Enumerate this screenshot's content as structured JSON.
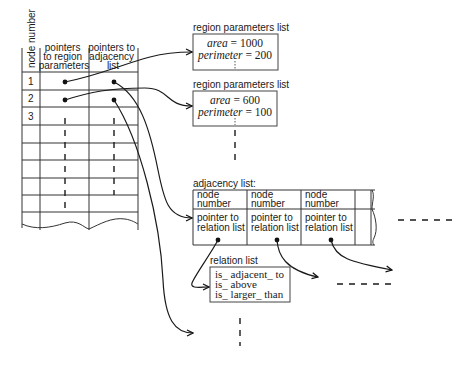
{
  "node_table": {
    "headers": {
      "node_number": "node number",
      "region_ptr": [
        "pointers",
        "to region",
        "parameters"
      ],
      "adjacency_ptr": [
        "pointers to",
        "adjacency",
        "list"
      ]
    },
    "rows": [
      "1",
      "2",
      "3",
      "",
      "",
      "",
      "",
      "",
      ""
    ]
  },
  "region_lists": [
    {
      "title": "region parameters list",
      "area_label": "area",
      "area_value": "1000",
      "perimeter_label": "perimeter",
      "perimeter_value": "200"
    },
    {
      "title": "region parameters list",
      "area_label": "area",
      "area_value": "600",
      "perimeter_label": "perimeter",
      "perimeter_value": "100"
    }
  ],
  "adjacency_list": {
    "title": "adjacency list:",
    "cells": [
      {
        "node": [
          "node",
          "number"
        ],
        "pointer": [
          "pointer to",
          "relation list"
        ]
      },
      {
        "node": [
          "node",
          "number"
        ],
        "pointer": [
          "pointer to",
          "relation list"
        ]
      },
      {
        "node": [
          "node",
          "number"
        ],
        "pointer": [
          "pointer to",
          "relation list"
        ]
      }
    ]
  },
  "relation_list": {
    "title": "relation list",
    "items": [
      "is_ adjacent_ to",
      "is_ above",
      "is_ larger_ than"
    ]
  }
}
